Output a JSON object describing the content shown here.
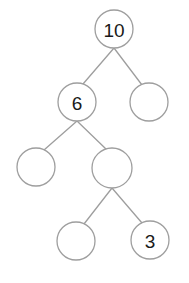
{
  "diagram": {
    "type": "number-bond-tree",
    "canvas": {
      "width": 189,
      "height": 283,
      "background": "#ffffff"
    },
    "style": {
      "stroke_color": "#9e9e9e",
      "stroke_width": 1.3,
      "circle_fill": "#ffffff",
      "label_color": "#1a1a1a",
      "label_font_size": 19
    },
    "nodes": [
      {
        "id": "n0",
        "label": "10",
        "cx": 114,
        "cy": 29,
        "r": 19,
        "row": 1,
        "filled": true
      },
      {
        "id": "n1",
        "label": "6",
        "cx": 77,
        "cy": 102,
        "r": 19,
        "row": 2,
        "filled": true
      },
      {
        "id": "n2",
        "label": "",
        "cx": 149,
        "cy": 102,
        "r": 19,
        "row": 2,
        "filled": false
      },
      {
        "id": "n3",
        "label": "",
        "cx": 36,
        "cy": 167,
        "r": 19,
        "row": 3,
        "filled": false
      },
      {
        "id": "n4",
        "label": "",
        "cx": 112,
        "cy": 168,
        "r": 20,
        "row": 3,
        "filled": false
      },
      {
        "id": "n5",
        "label": "",
        "cx": 76,
        "cy": 241,
        "r": 19,
        "row": 4,
        "filled": false
      },
      {
        "id": "n6",
        "label": "3",
        "cx": 150,
        "cy": 240,
        "r": 19,
        "row": 4,
        "filled": true
      }
    ],
    "edges": [
      {
        "id": "e0",
        "from": "n0",
        "to": "n1",
        "x1": 114,
        "y1": 48,
        "x2": 83,
        "y2": 84
      },
      {
        "id": "e1",
        "from": "n0",
        "to": "n2",
        "x1": 114,
        "y1": 48,
        "x2": 142,
        "y2": 85
      },
      {
        "id": "e2",
        "from": "n1",
        "to": "n3",
        "x1": 77,
        "y1": 121,
        "x2": 44,
        "y2": 150
      },
      {
        "id": "e3",
        "from": "n1",
        "to": "n4",
        "x1": 77,
        "y1": 121,
        "x2": 106,
        "y2": 149
      },
      {
        "id": "e4",
        "from": "n4",
        "to": "n5",
        "x1": 112,
        "y1": 188,
        "x2": 84,
        "y2": 224
      },
      {
        "id": "e5",
        "from": "n4",
        "to": "n6",
        "x1": 112,
        "y1": 188,
        "x2": 142,
        "y2": 223
      }
    ]
  }
}
